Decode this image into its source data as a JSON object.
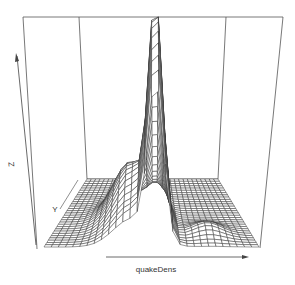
{
  "chart_data": {
    "type": "surface",
    "subtype": "persp",
    "title": "",
    "xlabel": "quakeDens",
    "ylabel": "Y",
    "zlabel": "Z",
    "axes_ticks": false,
    "grid_resolution": [
      30,
      30
    ],
    "peak": {
      "x_frac": 0.5,
      "y_frac": 0.92,
      "z_frac": 1.0
    },
    "colors": {
      "line": "#333333",
      "box": "#555555",
      "background": "#ffffff",
      "surface_fill": "#ffffff"
    }
  },
  "labels": {
    "x": "quakeDens",
    "y": "Y",
    "z": "Z"
  },
  "box": {
    "top_y": 17,
    "top_left_x": 23,
    "top_right_x": 283,
    "back_left_top_x": 79,
    "back_right_top_x": 226,
    "floor": {
      "back_left": [
        87,
        179
      ],
      "back_right": [
        218,
        179
      ],
      "front_left": [
        44,
        247
      ],
      "front_right": [
        259,
        247
      ]
    }
  }
}
